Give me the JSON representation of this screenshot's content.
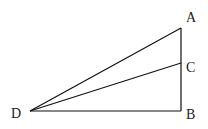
{
  "diagram": {
    "type": "geometry-figure",
    "stroke_color": "#111111",
    "background_color": "#ffffff",
    "points": {
      "A": {
        "label": "A",
        "x": 181,
        "y": 28,
        "label_x": 186,
        "label_y": 22
      },
      "C": {
        "label": "C",
        "x": 181,
        "y": 63,
        "label_x": 186,
        "label_y": 72
      },
      "B": {
        "label": "B",
        "x": 181,
        "y": 111,
        "label_x": 186,
        "label_y": 119
      },
      "D": {
        "label": "D",
        "x": 30,
        "y": 111,
        "label_x": 11,
        "label_y": 118
      }
    },
    "segments": [
      {
        "from": "D",
        "to": "A"
      },
      {
        "from": "D",
        "to": "C"
      },
      {
        "from": "D",
        "to": "B"
      },
      {
        "from": "A",
        "to": "B"
      }
    ]
  }
}
